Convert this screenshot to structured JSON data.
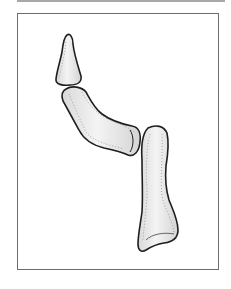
{
  "figure": {
    "parts": [
      {
        "name": "distal-phalanx"
      },
      {
        "name": "middle-phalanx"
      },
      {
        "name": "proximal-phalanx"
      }
    ],
    "colors": {
      "outline": "#1f1f1f",
      "bone_fill": "#e6e6e6",
      "bone_highlight": "#f6f6f6",
      "stipple": "#8a8a8a",
      "frame_border": "#6e6e6e",
      "top_rule": "#a8a8a8"
    }
  }
}
